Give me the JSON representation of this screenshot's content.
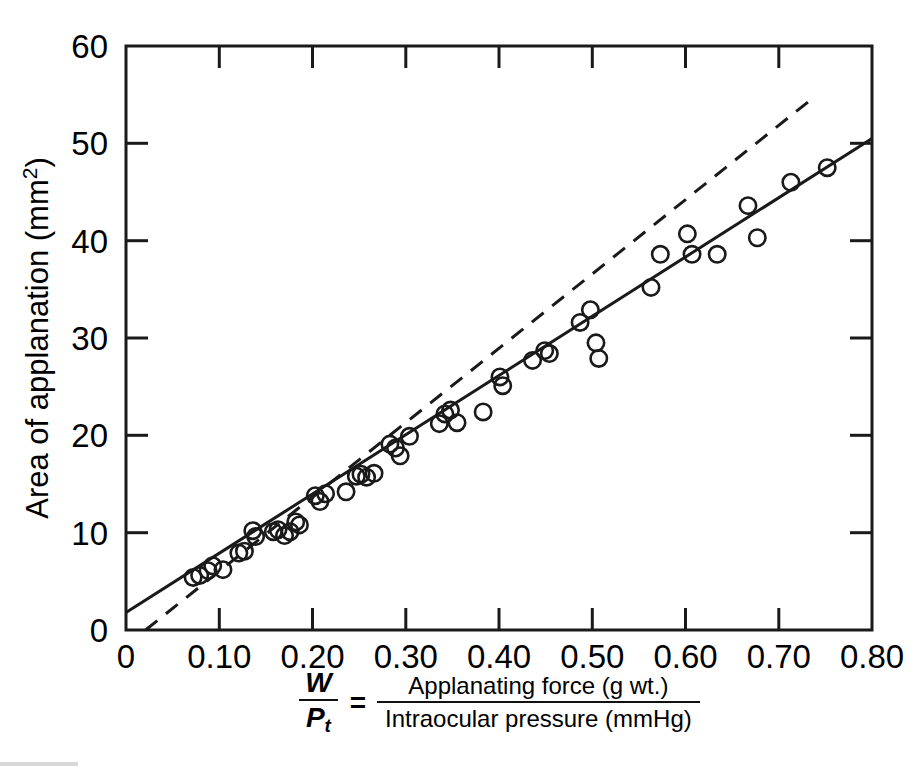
{
  "figure": {
    "width": 918,
    "height": 772,
    "background": "#ffffff",
    "ink_color": "#1a1a1a"
  },
  "chart_data": {
    "type": "scatter",
    "title": "",
    "subtitle": "",
    "xlabel": "W/Pt = Applanating force (g wt.) / Intraocular pressure (mmHg)",
    "ylabel": "Area of applanation (mm2)",
    "xlim": [
      0,
      0.8
    ],
    "ylim": [
      0,
      60
    ],
    "xticks": [
      0,
      0.1,
      0.2,
      0.3,
      0.4,
      0.5,
      0.6,
      0.7,
      0.8
    ],
    "xticklabels": [
      "0",
      "0.10",
      "0.20",
      "0.30",
      "0.40",
      "0.50",
      "0.60",
      "0.70",
      "0.80"
    ],
    "yticks": [
      0,
      10,
      20,
      30,
      40,
      50,
      60
    ],
    "yticklabels": [
      "0",
      "10",
      "20",
      "30",
      "40",
      "50",
      "60"
    ],
    "grid": false,
    "legend": false,
    "legend_position": "none",
    "marker": "open-circle",
    "points": [
      {
        "x": 0.072,
        "y": 5.4
      },
      {
        "x": 0.079,
        "y": 5.6
      },
      {
        "x": 0.088,
        "y": 6.1
      },
      {
        "x": 0.093,
        "y": 6.6
      },
      {
        "x": 0.104,
        "y": 6.2
      },
      {
        "x": 0.121,
        "y": 7.9
      },
      {
        "x": 0.127,
        "y": 8.1
      },
      {
        "x": 0.136,
        "y": 10.2
      },
      {
        "x": 0.139,
        "y": 9.6
      },
      {
        "x": 0.158,
        "y": 10.1
      },
      {
        "x": 0.163,
        "y": 10.3
      },
      {
        "x": 0.17,
        "y": 9.7
      },
      {
        "x": 0.176,
        "y": 10.1
      },
      {
        "x": 0.182,
        "y": 11.1
      },
      {
        "x": 0.186,
        "y": 10.8
      },
      {
        "x": 0.203,
        "y": 13.8
      },
      {
        "x": 0.208,
        "y": 13.2
      },
      {
        "x": 0.214,
        "y": 14.0
      },
      {
        "x": 0.236,
        "y": 14.2
      },
      {
        "x": 0.247,
        "y": 15.8
      },
      {
        "x": 0.252,
        "y": 16.0
      },
      {
        "x": 0.258,
        "y": 15.7
      },
      {
        "x": 0.266,
        "y": 16.1
      },
      {
        "x": 0.283,
        "y": 19.1
      },
      {
        "x": 0.289,
        "y": 18.7
      },
      {
        "x": 0.294,
        "y": 17.9
      },
      {
        "x": 0.304,
        "y": 19.9
      },
      {
        "x": 0.336,
        "y": 21.2
      },
      {
        "x": 0.342,
        "y": 22.2
      },
      {
        "x": 0.348,
        "y": 22.6
      },
      {
        "x": 0.355,
        "y": 21.3
      },
      {
        "x": 0.383,
        "y": 22.4
      },
      {
        "x": 0.401,
        "y": 26.0
      },
      {
        "x": 0.404,
        "y": 25.1
      },
      {
        "x": 0.436,
        "y": 27.7
      },
      {
        "x": 0.449,
        "y": 28.7
      },
      {
        "x": 0.454,
        "y": 28.4
      },
      {
        "x": 0.487,
        "y": 31.6
      },
      {
        "x": 0.498,
        "y": 32.9
      },
      {
        "x": 0.504,
        "y": 29.5
      },
      {
        "x": 0.507,
        "y": 27.9
      },
      {
        "x": 0.563,
        "y": 35.2
      },
      {
        "x": 0.573,
        "y": 38.6
      },
      {
        "x": 0.602,
        "y": 40.7
      },
      {
        "x": 0.607,
        "y": 38.6
      },
      {
        "x": 0.634,
        "y": 38.6
      },
      {
        "x": 0.667,
        "y": 43.6
      },
      {
        "x": 0.677,
        "y": 40.3
      },
      {
        "x": 0.713,
        "y": 46.0
      },
      {
        "x": 0.752,
        "y": 47.5
      }
    ],
    "lines": [
      {
        "name": "regression-line-solid",
        "style": "solid",
        "x_start": 0.0,
        "y_start": 1.8,
        "x_end": 0.8,
        "y_end": 50.5
      },
      {
        "name": "reference-line-dashed",
        "style": "dashed",
        "x_start": 0.021,
        "y_start": 0.0,
        "x_end": 0.736,
        "y_end": 54.6
      }
    ]
  },
  "axis_titles": {
    "y": {
      "text_main": "Area of applanation (mm",
      "superscript": "2",
      "text_tail": ")"
    },
    "x": {
      "lhs_numerator": "W",
      "lhs_denominator": "P",
      "lhs_denominator_sub": "t",
      "equals": "=",
      "rhs_numerator": "Applanating force (g wt.)",
      "rhs_denominator": "Intraocular pressure (mmHg)"
    }
  }
}
